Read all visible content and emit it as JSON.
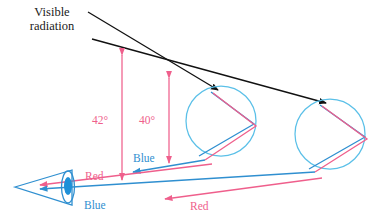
{
  "figure": {
    "title_label": "Visible\nradiation",
    "labels": {
      "visible_radiation": "Visible\nradiation",
      "angle_outer": "42°",
      "angle_inner": "40°",
      "blue_upper": "Blue",
      "red_upper": "Red",
      "blue_lower": "Blue",
      "red_lower": "Red"
    },
    "colors": {
      "red_ray": "#ef5f8c",
      "blue_ray": "#2f8fd0",
      "droplet_outline": "#5bc0e8",
      "incident_ray": "#111111",
      "eye_outline": "#2f8fd0",
      "pupil_fill": "#1e90d8",
      "background": "#ffffff"
    },
    "elements": {
      "droplet_upper_label": "raindrop-upper",
      "droplet_lower_label": "raindrop-lower",
      "eye_label": "observer-eye"
    },
    "geometry": {
      "width": 371,
      "height": 221,
      "droplet_upper_center": [
        221,
        121
      ],
      "droplet_upper_radius": 35,
      "droplet_lower_center": [
        330,
        134
      ],
      "droplet_lower_radius": 35,
      "eye_apex": [
        15,
        185
      ],
      "angle_outer_x": 122,
      "angle_inner_x": 169
    }
  }
}
